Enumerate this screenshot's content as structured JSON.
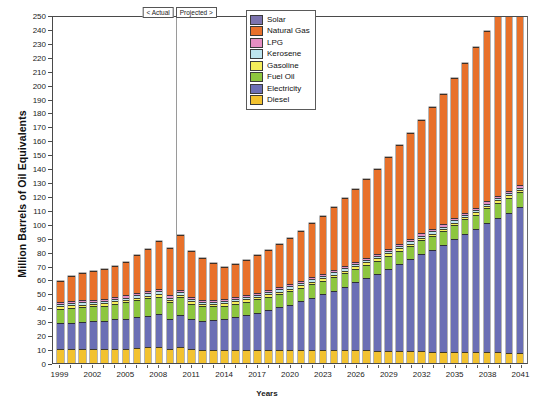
{
  "chart_data": {
    "type": "bar",
    "stacked": true,
    "title": "",
    "xlabel": "Years",
    "ylabel": "Million Barrels of Oil Equivalents",
    "ylim": [
      0,
      250
    ],
    "ytick_step": 10,
    "yticks": [
      0,
      10,
      20,
      30,
      40,
      50,
      60,
      70,
      80,
      90,
      100,
      110,
      120,
      130,
      140,
      150,
      160,
      170,
      180,
      190,
      200,
      210,
      220,
      230,
      240,
      250
    ],
    "grid": false,
    "legend_position": "top-center",
    "xtick_step": 3,
    "xtick_labels": [
      "1999",
      "2002",
      "2005",
      "2008",
      "2011",
      "2014",
      "2017",
      "2020",
      "2023",
      "2026",
      "2029",
      "2032",
      "2035",
      "2038",
      "2041"
    ],
    "categories": [
      "1999",
      "2000",
      "2001",
      "2002",
      "2003",
      "2004",
      "2005",
      "2006",
      "2007",
      "2008",
      "2009",
      "2010",
      "2011",
      "2012",
      "2013",
      "2014",
      "2015",
      "2016",
      "2017",
      "2018",
      "2019",
      "2020",
      "2021",
      "2022",
      "2023",
      "2024",
      "2025",
      "2026",
      "2027",
      "2028",
      "2029",
      "2030",
      "2031",
      "2032",
      "2033",
      "2034",
      "2035",
      "2036",
      "2037",
      "2038",
      "2039",
      "2040",
      "2041"
    ],
    "series": [
      {
        "name": "Diesel",
        "color": "#F2C230",
        "values": [
          9,
          9,
          9,
          9,
          9,
          9.5,
          9.5,
          10,
          10.5,
          11,
          9.5,
          10.5,
          9,
          8.5,
          8.5,
          8.5,
          8.5,
          8.5,
          8.5,
          8.5,
          8.5,
          8.5,
          8.5,
          8.5,
          8.5,
          8.5,
          8.5,
          8.5,
          8.5,
          8,
          8,
          8,
          8,
          8,
          7.5,
          7.5,
          7.5,
          7.5,
          7,
          7,
          7,
          6.5,
          6.5
        ]
      },
      {
        "name": "Electricity",
        "color": "#6B6FB5",
        "values": [
          18,
          18.5,
          19,
          19.5,
          20,
          20.5,
          21,
          21.5,
          22,
          22.5,
          21,
          22.5,
          21,
          20.5,
          21,
          21.5,
          23,
          24.5,
          26,
          28,
          30,
          32,
          34.5,
          37,
          39.5,
          42,
          45,
          48,
          51,
          54.5,
          58,
          61.5,
          65,
          69,
          72.5,
          76,
          80,
          84,
          88,
          92,
          96,
          100,
          104
        ]
      },
      {
        "name": "Fuel Oil",
        "color": "#8DC63F",
        "values": [
          10,
          10,
          10,
          10,
          10,
          10.5,
          11,
          11.5,
          12,
          12,
          11,
          12,
          10.5,
          9.5,
          9,
          9,
          9,
          9,
          9,
          9,
          9,
          9,
          9,
          9,
          9,
          9,
          9,
          9,
          9,
          9,
          9,
          9,
          9,
          9,
          9,
          9,
          9.5,
          9.5,
          9.5,
          10,
          10,
          10,
          10
        ]
      },
      {
        "name": "Gasoline",
        "color": "#F5EE5B",
        "values": [
          1,
          1,
          1,
          1,
          1,
          1,
          1,
          1,
          1,
          1,
          1,
          1,
          1,
          1,
          1,
          1,
          1,
          1,
          1,
          1,
          1,
          1,
          1,
          1,
          1,
          1,
          1,
          1,
          1,
          1,
          1,
          1,
          1,
          1,
          1,
          1,
          1,
          1,
          1,
          1,
          1,
          1,
          1
        ]
      },
      {
        "name": "Kerosene",
        "color": "#BDE4EE",
        "values": [
          1,
          1,
          1,
          1,
          1,
          1,
          1,
          1,
          1.5,
          1.5,
          1,
          1.5,
          1,
          1,
          1,
          1,
          1,
          1,
          1,
          1,
          1,
          1,
          1,
          1,
          1,
          1,
          1,
          1,
          1,
          1,
          1,
          1,
          1,
          1,
          1,
          1,
          1,
          1,
          1,
          1,
          1,
          1,
          1
        ]
      },
      {
        "name": "LPG",
        "color": "#E58FC2",
        "values": [
          0.8,
          0.8,
          0.8,
          0.8,
          0.8,
          0.8,
          0.8,
          0.8,
          0.8,
          0.8,
          0.8,
          0.8,
          0.8,
          0.8,
          0.8,
          0.8,
          0.8,
          0.8,
          0.8,
          0.8,
          0.8,
          0.8,
          0.8,
          0.8,
          0.8,
          0.8,
          0.8,
          0.8,
          0.8,
          0.8,
          0.8,
          0.8,
          0.8,
          0.8,
          0.8,
          0.8,
          0.8,
          0.8,
          0.8,
          0.8,
          0.8,
          0.8,
          0.8
        ]
      },
      {
        "name": "Natural Gas",
        "color": "#E8712B",
        "values": [
          14,
          17.5,
          19,
          19.5,
          20.5,
          21.5,
          23.5,
          26.5,
          29,
          34,
          33,
          38.5,
          32,
          29,
          25.5,
          22,
          23,
          24.5,
          26,
          28,
          30,
          32.5,
          35,
          38,
          41,
          44.5,
          48,
          52,
          56,
          60,
          65,
          70,
          75.5,
          81,
          87,
          93,
          100,
          107,
          114.5,
          122,
          130,
          138.5,
          147
        ]
      },
      {
        "name": "Solar",
        "color": "#7C73AE",
        "values": [
          0,
          0,
          0,
          0,
          0,
          0,
          0,
          0,
          0,
          0,
          0,
          0,
          0,
          0,
          0,
          0,
          0,
          0,
          0,
          0,
          0,
          0,
          0,
          0,
          0,
          0,
          0,
          0,
          0,
          0,
          0,
          0,
          0,
          0,
          0,
          0,
          0,
          0,
          0,
          0,
          0,
          0,
          0
        ]
      }
    ],
    "legend_order": [
      "Solar",
      "Natural Gas",
      "LPG",
      "Kerosene",
      "Gasoline",
      "Fuel Oil",
      "Electricity",
      "Diesel"
    ],
    "annotations": [
      {
        "name": "actual-marker",
        "text": "< Actual"
      },
      {
        "name": "projected-marker",
        "text": "Projected >"
      }
    ],
    "divider_between": [
      "2009",
      "2010"
    ]
  }
}
